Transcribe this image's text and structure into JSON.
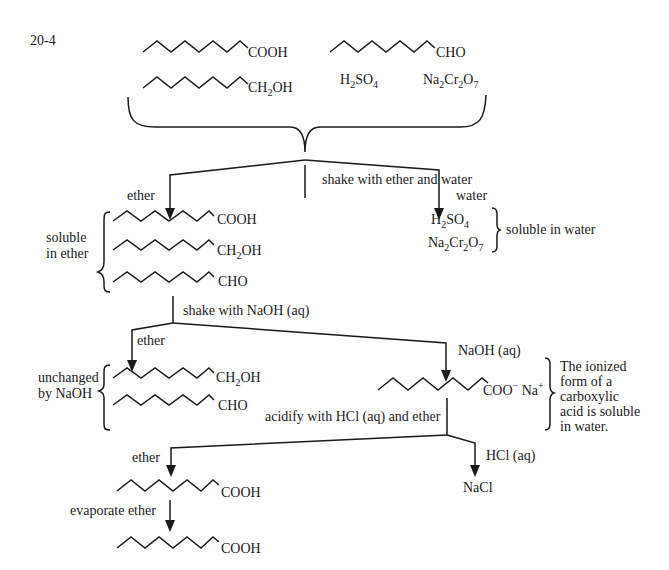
{
  "problem_number": "20-4",
  "start_mixture": {
    "compounds": [
      "COOH",
      "CHO",
      "CH2OH",
      "H2SO4",
      "Na2Cr2O7"
    ]
  },
  "steps": {
    "step1": "shake with ether and water",
    "step2": "shake with NaOH (aq)",
    "step3": "acidify with HCl (aq) and ether",
    "step4": "evaporate ether"
  },
  "labels": {
    "ether_1": "ether",
    "water_1": "water",
    "soluble_in_ether_line1": "soluble",
    "soluble_in_ether_line2": "in ether",
    "soluble_in_water": "soluble in water",
    "ether_2": "ether",
    "naoh_aq": "NaOH (aq)",
    "unchanged_line1": "unchanged",
    "unchanged_line2": "by NaOH",
    "ionized_note": [
      "The ionized",
      "form of a",
      "carboxylic",
      "acid is soluble",
      "in water."
    ],
    "ether_3": "ether",
    "hcl_aq": "HCl (aq)",
    "nacl": "NaCl"
  },
  "groups": {
    "cooh": "COOH",
    "cho": "CHO",
    "ch2oh_main": "CH",
    "ch2oh_sub": "2",
    "ch2oh_tail": "OH",
    "h2so4": [
      "H",
      "2",
      "SO",
      "4"
    ],
    "na2cr2o7": [
      "Na",
      "2",
      "Cr",
      "2",
      "O",
      "7"
    ],
    "carboxylate": "COO",
    "minus": "−",
    "sodium": " Na",
    "plus": "+"
  }
}
